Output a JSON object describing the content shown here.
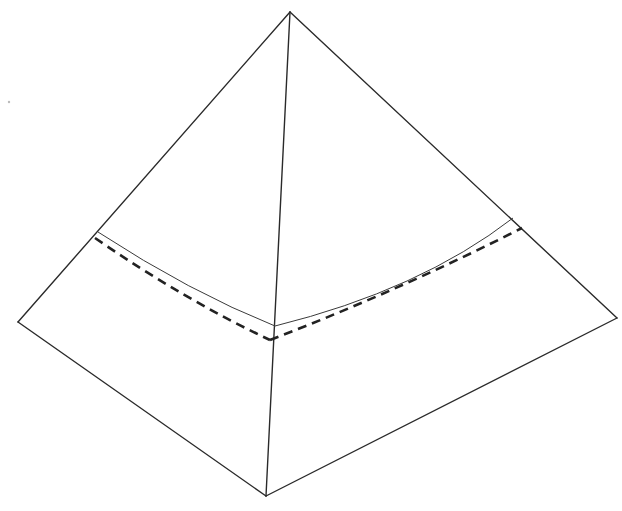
{
  "figure": {
    "width": 622,
    "height": 511,
    "colors": {
      "background": "#ffffff",
      "line": "#2a2a2a",
      "dashed": "#222222"
    },
    "vertices": {
      "apex": [
        290,
        12
      ],
      "left": [
        18,
        322
      ],
      "right": [
        617,
        318
      ],
      "bottom": [
        266,
        496
      ]
    },
    "curves": {
      "solid": {
        "style": "thin solid",
        "start": [
          98,
          232
        ],
        "middle": [
          275,
          326
        ],
        "end": [
          513,
          218
        ]
      },
      "dashed": {
        "style": "bold dashed",
        "start": [
          95,
          238
        ],
        "middle": [
          270,
          340
        ],
        "end": [
          522,
          228
        ]
      }
    }
  }
}
